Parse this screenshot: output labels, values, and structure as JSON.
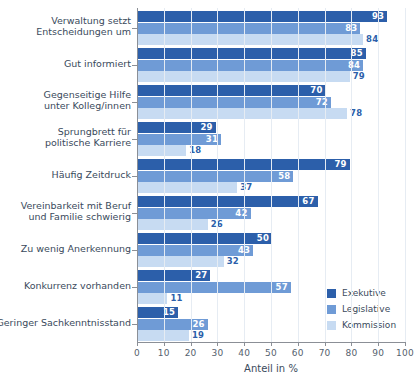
{
  "chart_data": {
    "type": "bar",
    "orientation": "horizontal",
    "title": "",
    "xlabel": "Anteil in %",
    "ylabel": "",
    "xlim": [
      0,
      100
    ],
    "xticks": [
      0,
      10,
      20,
      30,
      40,
      50,
      60,
      70,
      80,
      90,
      100
    ],
    "grid": true,
    "legend_position": "bottom-right",
    "categories": [
      "Verwaltung setzt\nEntscheidungen um",
      "Gut informiert",
      "Gegenseitige Hilfe\nunter Kolleg/innen",
      "Sprungbrett für\npolitische Karriere",
      "Häufig Zeitdruck",
      "Vereinbarkeit mit Beruf\nund Familie schwierig",
      "Zu wenig Anerkennung",
      "Konkurrenz vorhanden",
      "Geringer Sachkenntnisstand"
    ],
    "series": [
      {
        "name": "Exekutive",
        "color": "#2c5faa",
        "values": [
          93,
          85,
          70,
          29,
          79,
          67,
          50,
          27,
          15
        ]
      },
      {
        "name": "Legislative",
        "color": "#6f9bd6",
        "values": [
          83,
          84,
          72,
          31,
          58,
          42,
          43,
          57,
          26
        ]
      },
      {
        "name": "Kommission",
        "color": "#c7dbf2",
        "values": [
          84,
          79,
          78,
          18,
          37,
          26,
          32,
          11,
          19
        ]
      }
    ]
  },
  "axis": {
    "x_title": "Anteil in %",
    "tick_labels": [
      "0",
      "10",
      "20",
      "30",
      "40",
      "50",
      "60",
      "70",
      "80",
      "90",
      "100"
    ]
  },
  "categories": [
    {
      "line1": "Verwaltung setzt",
      "line2": "Entscheidungen um"
    },
    {
      "line1": "Gut informiert",
      "line2": ""
    },
    {
      "line1": "Gegenseitige Hilfe",
      "line2": "unter Kolleg/innen"
    },
    {
      "line1": "Sprungbrett für",
      "line2": "politische Karriere"
    },
    {
      "line1": "Häufig Zeitdruck",
      "line2": ""
    },
    {
      "line1": "Vereinbarkeit mit Beruf",
      "line2": "und Familie schwierig"
    },
    {
      "line1": "Zu wenig Anerkennung",
      "line2": ""
    },
    {
      "line1": "Konkurrenz vorhanden",
      "line2": ""
    },
    {
      "line1": "Geringer Sachkenntnisstand",
      "line2": ""
    }
  ],
  "legend": {
    "items": [
      {
        "label": "Exekutive",
        "color": "#2c5faa"
      },
      {
        "label": "Legislative",
        "color": "#6f9bd6"
      },
      {
        "label": "Kommission",
        "color": "#c7dbf2"
      }
    ]
  }
}
